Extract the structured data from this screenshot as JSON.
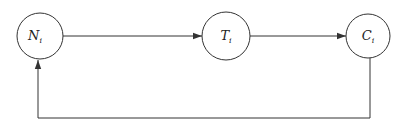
{
  "diagram": {
    "type": "cycle-flow",
    "nodes": [
      {
        "id": "N",
        "label": "N",
        "subscript": "i",
        "cx": 40,
        "cy": 36,
        "r": 23
      },
      {
        "id": "T",
        "label": "T",
        "subscript": "i",
        "cx": 226,
        "cy": 36,
        "r": 24
      },
      {
        "id": "C",
        "label": "C",
        "subscript": "i",
        "cx": 368,
        "cy": 36,
        "r": 22
      }
    ],
    "edges": [
      {
        "from": "N",
        "to": "T",
        "kind": "direct"
      },
      {
        "from": "T",
        "to": "C",
        "kind": "direct"
      },
      {
        "from": "C",
        "to": "N",
        "kind": "feedback-loop-below",
        "bottom_y": 118
      }
    ],
    "colors": {
      "stroke": "#333333",
      "background": "#ffffff",
      "text": "#222222"
    }
  }
}
